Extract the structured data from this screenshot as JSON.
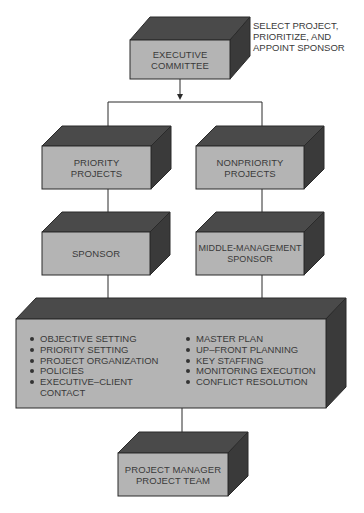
{
  "diagram": {
    "annotation": "SELECT PROJECT,\nPRIORITIZE, AND\nAPPOINT SPONSOR",
    "boxes": {
      "executive_committee": "EXECUTIVE\nCOMMITTEE",
      "priority_projects": "PRIORITY\nPROJECTS",
      "nonpriority_projects": "NONPRIORITY\nPROJECTS",
      "sponsor": "SPONSOR",
      "middle_management_sponsor": "MIDDLE-MANAGEMENT\nSPONSOR",
      "project_manager_team": "PROJECT MANAGER\nPROJECT TEAM"
    },
    "responsibilities": {
      "left": [
        "OBJECTIVE SETTING",
        "PRIORITY SETTING",
        "PROJECT ORGANIZATION",
        "POLICIES",
        "EXECUTIVE–CLIENT"
      ],
      "left_continuation": "CONTACT",
      "right": [
        "MASTER PLAN",
        "UP–FRONT PLANNING",
        "KEY STAFFING",
        "MONITORING EXECUTION",
        "CONFLICT RESOLUTION"
      ]
    },
    "colors": {
      "front": "#b4b4b4",
      "top": "#4a4a4a",
      "side": "#3a3a3a",
      "outline": "#2a2a2a",
      "connector": "#2a2a2a"
    }
  }
}
